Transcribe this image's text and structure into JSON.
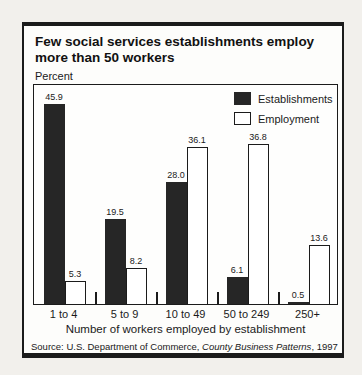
{
  "panel": {
    "title": "Few social services establishments employ more than 50 workers",
    "y_unit_label": "Percent",
    "axis_title": "Number of workers employed by establishment",
    "source_prefix": "Source: U.S. Department of Commerce, ",
    "source_italic": "County Business Patterns",
    "source_suffix": ", 1997"
  },
  "legend": {
    "items": [
      {
        "label": "Establishments",
        "swatch": "black-filled"
      },
      {
        "label": "Employment",
        "swatch": "white-outlined"
      }
    ]
  },
  "chart_data": {
    "type": "bar",
    "title": "Few social services establishments employ more than 50 workers",
    "xlabel": "Number of workers employed by establishment",
    "ylabel": "Percent",
    "categories": [
      "1 to 4",
      "5 to 9",
      "10 to 49",
      "50 to 249",
      "250+"
    ],
    "series": [
      {
        "name": "Establishments",
        "color": "#262626",
        "values": [
          45.9,
          19.5,
          28.0,
          6.1,
          0.5
        ]
      },
      {
        "name": "Employment",
        "color": "#ffffff",
        "values": [
          5.3,
          8.2,
          36.1,
          36.8,
          13.6
        ]
      }
    ],
    "value_labels_shown": true,
    "ylim": [
      0,
      50
    ],
    "grid": false,
    "legend_position": "top-right",
    "source": "Source: U.S. Department of Commerce, County Business Patterns, 1997"
  },
  "colors": {
    "ink": "#1b1b1b",
    "bar_dark": "#262626",
    "bar_light": "#ffffff",
    "panel_background": "#fdfdfb",
    "page_background": "#f2f0ec"
  }
}
